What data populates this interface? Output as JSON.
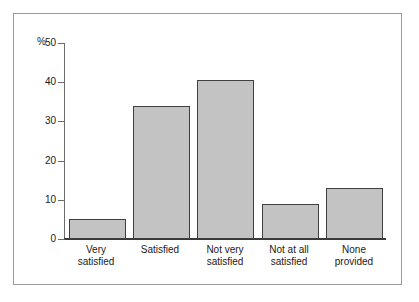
{
  "chart_data": {
    "type": "bar",
    "title": "",
    "subtitle": "",
    "xlabel": "",
    "ylabel": "%",
    "ylim": [
      0,
      50
    ],
    "yticks": [
      0,
      10,
      20,
      30,
      40,
      50
    ],
    "ytick_labels": [
      "0",
      "10",
      "20",
      "30",
      "40",
      "50"
    ],
    "grid": false,
    "legend": null,
    "categories": [
      "Very satisfied",
      "Satisfied",
      "Not very satisfied",
      "Not at all satisfied",
      "None provided"
    ],
    "category_lines": [
      [
        "Very",
        "satisfied"
      ],
      [
        "Satisfied",
        ""
      ],
      [
        "Not very",
        "satisfied"
      ],
      [
        "Not at all",
        "satisfied"
      ],
      [
        "None",
        "provided"
      ]
    ],
    "values": [
      5,
      34,
      40.5,
      9,
      13
    ],
    "bar_fill_color": "#c3c3c3",
    "bar_edge_color": "#3f3f3f",
    "axis_color": "#3a3a3a",
    "frame_color": "#9a9a9a",
    "background_color": "#ffffff"
  }
}
